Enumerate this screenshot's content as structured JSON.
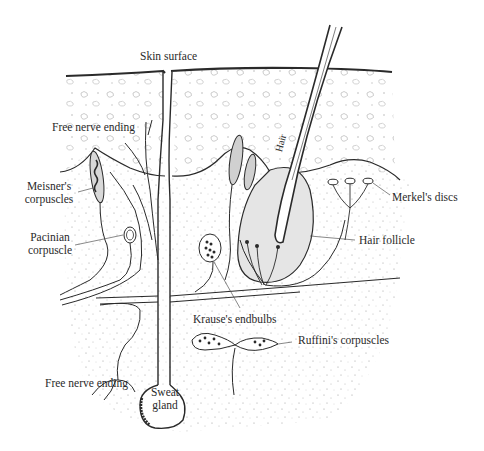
{
  "diagram": {
    "labels": {
      "skin_surface": "Skin surface",
      "free_nerve_ending_top": "Free nerve ending",
      "meisner_1": "Meisner's",
      "meisner_2": "corpuscles",
      "pacinian_1": "Pacinian",
      "pacinian_2": "corpuscle",
      "hair": "Hair",
      "merkel": "Merkel's discs",
      "hair_follicle": "Hair follicle",
      "krause": "Krause's endbulbs",
      "ruffini": "Ruffini's corpuscles",
      "free_nerve_ending_bottom": "Free nerve ending",
      "sweat_1": "Sweat",
      "sweat_2": "gland"
    },
    "colors": {
      "ink": "#2a2a2a",
      "paper": "#ffffff",
      "stipple": "#9a9a9a"
    }
  }
}
